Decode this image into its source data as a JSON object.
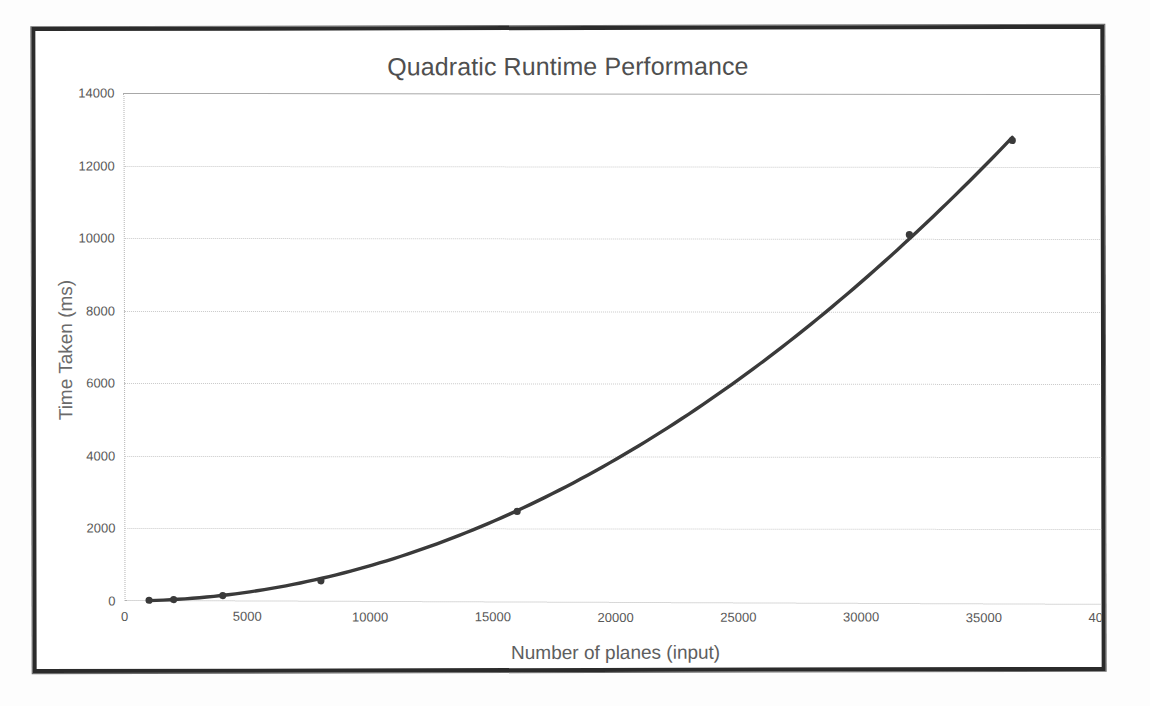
{
  "chart_data": {
    "type": "line",
    "title": "Quadratic Runtime Performance",
    "xlabel": "Number of planes (input)",
    "ylabel": "Time Taken (ms)",
    "xlim": [
      0,
      40000
    ],
    "ylim": [
      0,
      14000
    ],
    "grid": true,
    "legend": "none",
    "x_ticks": [
      "0",
      "5000",
      "10000",
      "15000",
      "20000",
      "25000",
      "30000",
      "35000",
      "40000"
    ],
    "x_tick_values": [
      0,
      5000,
      10000,
      15000,
      20000,
      25000,
      30000,
      35000,
      40000
    ],
    "y_ticks": [
      "0",
      "2000",
      "4000",
      "6000",
      "8000",
      "10000",
      "12000",
      "14000"
    ],
    "y_tick_values": [
      0,
      2000,
      4000,
      6000,
      8000,
      10000,
      12000,
      14000
    ],
    "series": [
      {
        "name": "Time Taken (ms)",
        "color": "#3a3a3a",
        "marker": "circle",
        "x": [
          1000,
          2000,
          4000,
          8000,
          16000,
          32000,
          36200
        ],
        "values": [
          20,
          40,
          150,
          560,
          2480,
          10120,
          12720
        ]
      }
    ]
  },
  "chart": {
    "title": "Quadratic Runtime Performance",
    "x_axis_title": "Number of planes (input)",
    "y_axis_title": "Time Taken (ms)"
  },
  "style": {
    "line_color": "#3a3a3a",
    "grid_color": "#c9c9c9",
    "frame_color": "#2b2b2b",
    "text_color": "#585858",
    "background": "#ffffff"
  }
}
